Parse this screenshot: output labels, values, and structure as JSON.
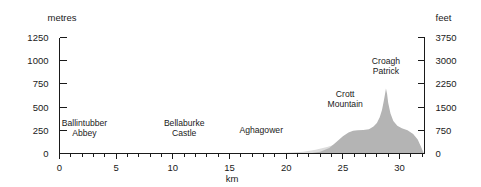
{
  "chart_data": {
    "type": "area",
    "title": "",
    "subtitle": "",
    "xlabel": "km",
    "ylabel_left": "metres",
    "ylabel_right": "feet",
    "xlim": [
      0,
      32.2
    ],
    "ylim": [
      0,
      1250
    ],
    "ylim_right": [
      0,
      3750
    ],
    "grid": false,
    "legend": "none",
    "x_ticks_major": [
      0,
      5,
      10,
      15,
      20,
      25,
      30
    ],
    "x_tick_labels": [
      "0",
      "5",
      "10",
      "15",
      "20",
      "25",
      "30"
    ],
    "x_minor_step": 1,
    "y_ticks_left": [
      0,
      250,
      500,
      750,
      1000,
      1250
    ],
    "y_tick_labels_left": [
      "0",
      "250",
      "500",
      "750",
      "1000",
      "1250"
    ],
    "y_ticks_right": [
      0,
      750,
      1500,
      2250,
      3000,
      3750
    ],
    "y_tick_labels_right": [
      "0",
      "750",
      "1500",
      "2250",
      "3000",
      "3750"
    ],
    "series": [
      {
        "name": "lower-terrain-band",
        "fill": "#dcdcdc",
        "x": [
          0,
          18.0,
          20.0,
          21.5,
          22.6,
          23.6,
          24.6,
          25.6,
          26.6,
          27.6,
          28.4,
          29.2,
          29.9,
          30.6,
          31.2,
          31.7,
          32.0,
          32.2
        ],
        "values": [
          0,
          0,
          8,
          20,
          40,
          70,
          108,
          148,
          182,
          208,
          224,
          228,
          224,
          212,
          180,
          110,
          40,
          0
        ]
      },
      {
        "name": "upper-terrain-silhouette",
        "fill": "#b4b4b4",
        "x": [
          22.0,
          23.0,
          23.8,
          24.4,
          25.0,
          25.5,
          25.9,
          26.3,
          26.8,
          27.3,
          27.7,
          28.0,
          28.25,
          28.45,
          28.6,
          28.72,
          28.8,
          28.9,
          29.0,
          29.2,
          29.45,
          29.8,
          30.2,
          30.7,
          31.2,
          31.6,
          31.9,
          32.1
        ],
        "values": [
          0,
          20,
          60,
          120,
          185,
          226,
          244,
          250,
          252,
          262,
          290,
          330,
          390,
          470,
          560,
          640,
          700,
          640,
          545,
          430,
          350,
          300,
          272,
          250,
          210,
          150,
          70,
          0
        ]
      }
    ],
    "annotations": [
      {
        "text_line1": "Ballintubber",
        "text_line2": "Abbey",
        "x_km": 2.2,
        "y_px": 126,
        "align": "center"
      },
      {
        "text_line1": "Bellaburke",
        "text_line2": "Castle",
        "x_km": 11.0,
        "y_px": 126,
        "align": "center"
      },
      {
        "text_line1": "Aghagower",
        "text_line2": "",
        "x_km": 17.8,
        "y_px": 133,
        "align": "center"
      },
      {
        "text_line1": "Crott",
        "text_line2": "Mountain",
        "x_km": 25.2,
        "y_px": 97,
        "align": "center"
      },
      {
        "text_line1": "Croagh",
        "text_line2": "Patrick",
        "x_km": 28.8,
        "y_px": 64,
        "align": "center"
      }
    ]
  },
  "axes": {
    "left_unit_label": "metres",
    "right_unit_label": "feet",
    "x_unit_label": "km"
  },
  "colors": {
    "background": "#ffffff",
    "axis": "#1a1a1a",
    "text": "#1a1a1a",
    "terrain_lower": "#dcdcdc",
    "terrain_upper": "#b4b4b4"
  }
}
